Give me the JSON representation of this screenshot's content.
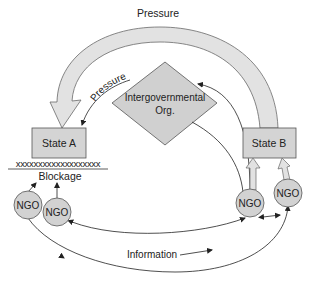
{
  "diagram": {
    "title_label": "Pressure",
    "inner_pressure_label": "Pressure",
    "igo": {
      "line1": "Intergovernmental",
      "line2": "Org."
    },
    "state_a": {
      "label": "State A"
    },
    "state_b": {
      "label": "State B"
    },
    "blockage": {
      "marks": "xxxxxxxxxxxxxxxxxxx",
      "label": "Blockage"
    },
    "ngos": [
      {
        "label": "NGO"
      },
      {
        "label": "NGO"
      },
      {
        "label": "NGO"
      },
      {
        "label": "NGO"
      }
    ],
    "information_label": "Information",
    "colors": {
      "box_fill": "#d4d4d4",
      "box_stroke": "#555555",
      "arrow_fill": "#e0e0e0",
      "ngo_fill": "#d2d2d2",
      "line": "#222222"
    }
  }
}
